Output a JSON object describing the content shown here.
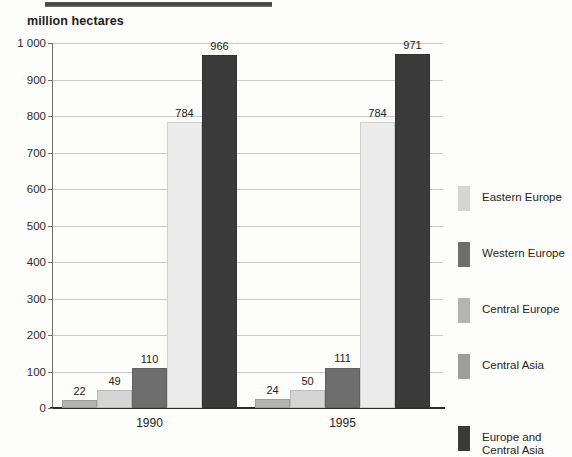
{
  "header": {
    "rule_name": "section-rule"
  },
  "chart_data": {
    "type": "bar",
    "title": "million hectares",
    "xlabel": "",
    "ylabel": "million hectares",
    "ylim": [
      0,
      1000
    ],
    "ytick_step": 100,
    "ytick_labels": [
      "1 000",
      "900",
      "800",
      "700",
      "600",
      "500",
      "400",
      "300",
      "200",
      "100",
      "0"
    ],
    "ytick_values": [
      1000,
      900,
      800,
      700,
      600,
      500,
      400,
      300,
      200,
      100,
      0
    ],
    "grid": true,
    "legend_position": "right",
    "categories": [
      "1990",
      "1995"
    ],
    "series": [
      {
        "name": "Eastern Europe",
        "values": [
          22,
          24
        ],
        "swatch": "#d5d5d5",
        "bar_fill": "#b4b4b4"
      },
      {
        "name": "Western Europe",
        "values": [
          49,
          50
        ],
        "swatch": "#6e6e6e",
        "bar_fill": "#d5d5d5"
      },
      {
        "name": "Central Europe",
        "values": [
          110,
          111
        ],
        "swatch": "#b4b4b4",
        "bar_fill": "#6e6e6e"
      },
      {
        "name": "Central Asia",
        "values": [
          784,
          784
        ],
        "swatch": "#9e9e9e",
        "bar_fill": "#ececec"
      },
      {
        "name": "Europe and\nCentral Asia",
        "values": [
          966,
          971
        ],
        "swatch": "#3a3a3a",
        "bar_fill": "#3a3a3a"
      }
    ],
    "bar_labels": {
      "1990": [
        "22",
        "49",
        "110",
        "784",
        "966"
      ],
      "1995": [
        "24",
        "50",
        "111",
        "784",
        "971"
      ]
    },
    "legend_labels": [
      "Eastern Europe",
      "Western Europe",
      "Central Europe",
      "Central Asia",
      "Europe and\nCentral Asia"
    ]
  },
  "colors": {
    "very_light": "#ececec",
    "light": "#d5d5d5",
    "medium": "#b4b4b4",
    "dark": "#6e6e6e",
    "very_dark": "#3a3a3a",
    "grid": "#c9c9c9",
    "axis": "#2a2a2a",
    "text": "#1f1f1f"
  }
}
